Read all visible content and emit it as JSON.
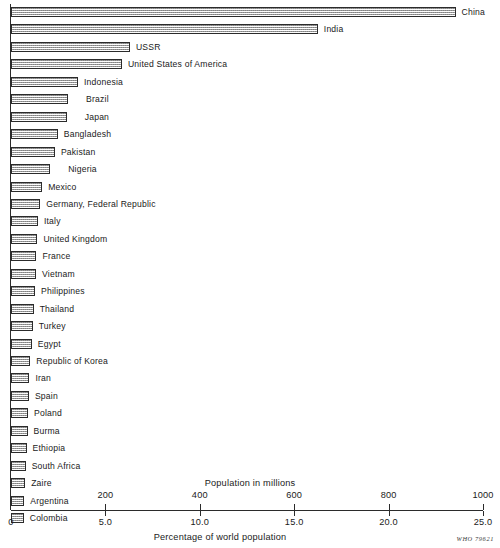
{
  "chart_data": {
    "type": "bar",
    "orientation": "horizontal",
    "title": "",
    "xlabel": "Percentage of world population",
    "xlabel_secondary": "Population in millions",
    "ylabel": "",
    "xlim_millions": [
      0,
      1000
    ],
    "xlim_percent": [
      0,
      25.0
    ],
    "grid": false,
    "legend": null,
    "source_code": "WHO 79621",
    "ticks_millions": [
      {
        "value": 200,
        "label": "200"
      },
      {
        "value": 400,
        "label": "400"
      },
      {
        "value": 600,
        "label": "600"
      },
      {
        "value": 800,
        "label": "800"
      },
      {
        "value": 1000,
        "label": "1000"
      }
    ],
    "ticks_percent": [
      {
        "value": 0.0,
        "label": "0"
      },
      {
        "value": 5.0,
        "label": "5.0"
      },
      {
        "value": 10.0,
        "label": "10.0"
      },
      {
        "value": 15.0,
        "label": "15.0"
      },
      {
        "value": 20.0,
        "label": "20.0"
      },
      {
        "value": 25.0,
        "label": "25.0"
      }
    ],
    "categories": [
      "China",
      "India",
      "USSR",
      "United States of America",
      "Indonesia",
      "Brazil",
      "Japan",
      "Bangladesh",
      "Pakistan",
      "Nigeria",
      "Mexico",
      "Germany, Federal Republic",
      "Italy",
      "United Kingdom",
      "France",
      "Vietnam",
      "Philippines",
      "Thailand",
      "Turkey",
      "Egypt",
      "Republic of Korea",
      "Iran",
      "Spain",
      "Poland",
      "Burma",
      "Ethiopia",
      "South Africa",
      "Zaire",
      "Argentina",
      "Colombia"
    ],
    "values": [
      942,
      650,
      252,
      235,
      142,
      121,
      118,
      99,
      93,
      83,
      66,
      62,
      57,
      56,
      54,
      53,
      51,
      48,
      46,
      44,
      41,
      39,
      38,
      36,
      35,
      33,
      31,
      30,
      28,
      27
    ],
    "units": "millions",
    "bar_label_offsets": [
      6,
      6,
      6,
      6,
      6,
      18,
      18,
      6,
      6,
      18,
      6,
      6,
      6,
      6,
      6,
      6,
      6,
      6,
      6,
      6,
      6,
      6,
      6,
      6,
      6,
      6,
      6,
      6,
      6,
      6
    ]
  },
  "axis": {
    "millions_title": "Population in millions",
    "percent_title": "Percentage of world population",
    "who_code": "WHO 79621"
  }
}
